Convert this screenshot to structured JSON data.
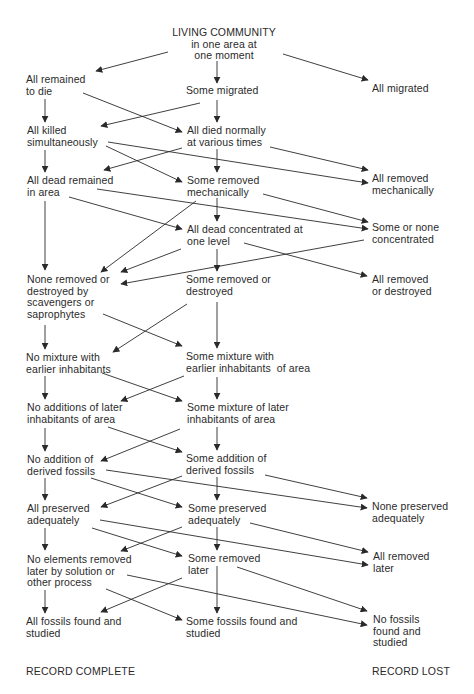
{
  "diagram": {
    "type": "flowchart",
    "nodes": [
      {
        "id": "root",
        "lines": [
          "LIVING COMMUNITY",
          "in one area at",
          "one moment"
        ],
        "x": 224,
        "y": 27,
        "align": "center"
      },
      {
        "id": "all_remained_to_die",
        "lines": [
          "All remained",
          "to die"
        ],
        "x": 26,
        "y": 74
      },
      {
        "id": "some_migrated",
        "lines": [
          "Some migrated"
        ],
        "x": 186,
        "y": 85
      },
      {
        "id": "all_migrated",
        "lines": [
          "All migrated"
        ],
        "x": 372,
        "y": 83
      },
      {
        "id": "all_killed_simultaneously",
        "lines": [
          "All killed",
          "simultaneously"
        ],
        "x": 27,
        "y": 125
      },
      {
        "id": "all_died_normally",
        "lines": [
          "All died normally",
          "at various times"
        ],
        "x": 187,
        "y": 125
      },
      {
        "id": "all_dead_remained",
        "lines": [
          "All dead remained",
          "in area"
        ],
        "x": 27,
        "y": 175
      },
      {
        "id": "some_removed_mechanically",
        "lines": [
          "Some removed",
          "mechanically"
        ],
        "x": 187,
        "y": 175
      },
      {
        "id": "all_removed_mechanically",
        "lines": [
          "All removed",
          "mechanically"
        ],
        "x": 372,
        "y": 173
      },
      {
        "id": "all_dead_concentrated",
        "lines": [
          "All dead concentrated at",
          "one level"
        ],
        "x": 187,
        "y": 224
      },
      {
        "id": "some_or_none_concentrated",
        "lines": [
          "Some or none",
          "concentrated"
        ],
        "x": 372,
        "y": 222
      },
      {
        "id": "none_removed_or_destroyed",
        "lines": [
          "None removed or",
          "destroyed by",
          "scavengers or",
          "saprophytes"
        ],
        "x": 27,
        "y": 274
      },
      {
        "id": "some_removed_or_destroyed",
        "lines": [
          "Some removed or",
          "destroyed"
        ],
        "x": 186,
        "y": 274
      },
      {
        "id": "all_removed_or_destroyed",
        "lines": [
          "All removed",
          "or destroyed"
        ],
        "x": 372,
        "y": 274
      },
      {
        "id": "no_mixture_earlier",
        "lines": [
          "No mixture with",
          "earlier inhabitants"
        ],
        "x": 26,
        "y": 352
      },
      {
        "id": "some_mixture_earlier",
        "lines": [
          "Some mixture with",
          "earlier inhabitants  of area"
        ],
        "x": 186,
        "y": 351
      },
      {
        "id": "no_additions_later",
        "lines": [
          "No additions of later",
          "inhabitants of area"
        ],
        "x": 27,
        "y": 402
      },
      {
        "id": "some_mixture_later",
        "lines": [
          "Some mixture of later",
          "inhabitants of area"
        ],
        "x": 187,
        "y": 402
      },
      {
        "id": "no_addition_derived",
        "lines": [
          "No addition of",
          "derived fossils"
        ],
        "x": 27,
        "y": 454
      },
      {
        "id": "some_addition_derived",
        "lines": [
          "Some addition of",
          "derived fossils"
        ],
        "x": 186,
        "y": 453
      },
      {
        "id": "all_preserved",
        "lines": [
          "All preserved",
          "adequately"
        ],
        "x": 27,
        "y": 503
      },
      {
        "id": "some_preserved",
        "lines": [
          "Some preserved",
          "adequately"
        ],
        "x": 188,
        "y": 503
      },
      {
        "id": "none_preserved",
        "lines": [
          "None preserved",
          "adequately"
        ],
        "x": 372,
        "y": 501
      },
      {
        "id": "no_elements_removed",
        "lines": [
          "No elements removed",
          "later by solution or",
          "other process"
        ],
        "x": 27,
        "y": 554
      },
      {
        "id": "some_removed_later",
        "lines": [
          "Some removed",
          "later"
        ],
        "x": 188,
        "y": 553
      },
      {
        "id": "all_removed_later",
        "lines": [
          "All removed",
          "later"
        ],
        "x": 373,
        "y": 551
      },
      {
        "id": "all_fossils_found",
        "lines": [
          "All fossils found and",
          "studied"
        ],
        "x": 26,
        "y": 616
      },
      {
        "id": "some_fossils_found",
        "lines": [
          "Some fossils found and",
          "studied"
        ],
        "x": 186,
        "y": 616
      },
      {
        "id": "no_fossils_found",
        "lines": [
          "No fossils",
          "found and",
          "studied"
        ],
        "x": 373,
        "y": 614
      }
    ],
    "edges": [
      {
        "from": "root",
        "to": "all_remained_to_die",
        "x1": 168,
        "y1": 52,
        "x2": 96,
        "y2": 71
      },
      {
        "from": "root",
        "to": "some_migrated",
        "x1": 217,
        "y1": 61,
        "x2": 217,
        "y2": 83
      },
      {
        "from": "root",
        "to": "all_migrated",
        "x1": 283,
        "y1": 54,
        "x2": 368,
        "y2": 80
      },
      {
        "from": "all_remained_to_die",
        "to": "all_killed_simultaneously",
        "x1": 45,
        "y1": 99,
        "x2": 45,
        "y2": 122
      },
      {
        "from": "all_remained_to_die",
        "to": "all_died_normally",
        "x1": 83,
        "y1": 93,
        "x2": 182,
        "y2": 132
      },
      {
        "from": "some_migrated",
        "to": "all_killed_simultaneously",
        "x1": 200,
        "y1": 103,
        "x2": 101,
        "y2": 126
      },
      {
        "from": "some_migrated",
        "to": "all_died_normally",
        "x1": 217,
        "y1": 100,
        "x2": 217,
        "y2": 122
      },
      {
        "from": "all_killed_simultaneously",
        "to": "all_dead_remained",
        "x1": 45,
        "y1": 150,
        "x2": 45,
        "y2": 172
      },
      {
        "from": "all_killed_simultaneously",
        "to": "some_removed_mechanically",
        "x1": 106,
        "y1": 146,
        "x2": 182,
        "y2": 182
      },
      {
        "from": "all_killed_simultaneously",
        "to": "all_removed_mechanically",
        "x1": 108,
        "y1": 142,
        "x2": 368,
        "y2": 183
      },
      {
        "from": "all_died_normally",
        "to": "all_dead_remained",
        "x1": 182,
        "y1": 148,
        "x2": 104,
        "y2": 170
      },
      {
        "from": "all_died_normally",
        "to": "some_removed_mechanically",
        "x1": 217,
        "y1": 149,
        "x2": 217,
        "y2": 172
      },
      {
        "from": "all_died_normally",
        "to": "all_removed_mechanically",
        "x1": 270,
        "y1": 147,
        "x2": 368,
        "y2": 170
      },
      {
        "from": "all_dead_remained",
        "to": "none_removed_or_destroyed",
        "x1": 45,
        "y1": 201,
        "x2": 45,
        "y2": 270
      },
      {
        "from": "all_dead_remained",
        "to": "all_dead_concentrated",
        "x1": 69,
        "y1": 197,
        "x2": 182,
        "y2": 229
      },
      {
        "from": "all_dead_remained",
        "to": "some_or_none_concentrated",
        "x1": 97,
        "y1": 189,
        "x2": 368,
        "y2": 229
      },
      {
        "from": "some_removed_mechanically",
        "to": "none_removed_or_destroyed",
        "x1": 196,
        "y1": 201,
        "x2": 101,
        "y2": 272
      },
      {
        "from": "some_removed_mechanically",
        "to": "all_dead_concentrated",
        "x1": 217,
        "y1": 198,
        "x2": 217,
        "y2": 221
      },
      {
        "from": "some_removed_mechanically",
        "to": "some_or_none_concentrated",
        "x1": 263,
        "y1": 194,
        "x2": 368,
        "y2": 222
      },
      {
        "from": "all_dead_concentrated",
        "to": "none_removed_or_destroyed",
        "x1": 181,
        "y1": 249,
        "x2": 121,
        "y2": 272
      },
      {
        "from": "all_dead_concentrated",
        "to": "some_removed_or_destroyed",
        "x1": 217,
        "y1": 249,
        "x2": 217,
        "y2": 271
      },
      {
        "from": "all_dead_concentrated",
        "to": "all_removed_or_destroyed",
        "x1": 244,
        "y1": 243,
        "x2": 367,
        "y2": 276
      },
      {
        "from": "some_or_none_concentrated",
        "to": "none_removed_or_destroyed",
        "x1": 364,
        "y1": 240,
        "x2": 121,
        "y2": 284
      },
      {
        "from": "none_removed_or_destroyed",
        "to": "no_mixture_earlier",
        "x1": 45,
        "y1": 325,
        "x2": 45,
        "y2": 349
      },
      {
        "from": "none_removed_or_destroyed",
        "to": "some_mixture_earlier",
        "x1": 103,
        "y1": 314,
        "x2": 182,
        "y2": 346
      },
      {
        "from": "some_removed_or_destroyed",
        "to": "no_mixture_earlier",
        "x1": 187,
        "y1": 304,
        "x2": 113,
        "y2": 352
      },
      {
        "from": "some_removed_or_destroyed",
        "to": "some_mixture_earlier",
        "x1": 217,
        "y1": 302,
        "x2": 217,
        "y2": 348
      },
      {
        "from": "no_mixture_earlier",
        "to": "no_additions_later",
        "x1": 45,
        "y1": 376,
        "x2": 45,
        "y2": 399
      },
      {
        "from": "no_mixture_earlier",
        "to": "some_mixture_later",
        "x1": 102,
        "y1": 373,
        "x2": 182,
        "y2": 401
      },
      {
        "from": "some_mixture_earlier",
        "to": "no_additions_later",
        "x1": 184,
        "y1": 376,
        "x2": 121,
        "y2": 401
      },
      {
        "from": "some_mixture_earlier",
        "to": "some_mixture_later",
        "x1": 217,
        "y1": 377,
        "x2": 217,
        "y2": 399
      },
      {
        "from": "no_additions_later",
        "to": "no_addition_derived",
        "x1": 45,
        "y1": 428,
        "x2": 45,
        "y2": 451
      },
      {
        "from": "no_additions_later",
        "to": "some_addition_derived",
        "x1": 108,
        "y1": 427,
        "x2": 182,
        "y2": 452
      },
      {
        "from": "some_mixture_later",
        "to": "no_addition_derived",
        "x1": 180,
        "y1": 429,
        "x2": 101,
        "y2": 461
      },
      {
        "from": "some_mixture_later",
        "to": "some_addition_derived",
        "x1": 217,
        "y1": 427,
        "x2": 217,
        "y2": 450
      },
      {
        "from": "no_addition_derived",
        "to": "all_preserved",
        "x1": 45,
        "y1": 478,
        "x2": 45,
        "y2": 500
      },
      {
        "from": "no_addition_derived",
        "to": "some_preserved",
        "x1": 91,
        "y1": 478,
        "x2": 182,
        "y2": 507
      },
      {
        "from": "no_addition_derived",
        "to": "none_preserved",
        "x1": 106,
        "y1": 470,
        "x2": 367,
        "y2": 508
      },
      {
        "from": "some_addition_derived",
        "to": "all_preserved",
        "x1": 182,
        "y1": 476,
        "x2": 101,
        "y2": 507
      },
      {
        "from": "some_addition_derived",
        "to": "some_preserved",
        "x1": 217,
        "y1": 477,
        "x2": 217,
        "y2": 500
      },
      {
        "from": "some_addition_derived",
        "to": "none_preserved",
        "x1": 265,
        "y1": 475,
        "x2": 367,
        "y2": 498
      },
      {
        "from": "all_preserved",
        "to": "no_elements_removed",
        "x1": 45,
        "y1": 528,
        "x2": 45,
        "y2": 550
      },
      {
        "from": "all_preserved",
        "to": "some_removed_later",
        "x1": 92,
        "y1": 528,
        "x2": 182,
        "y2": 556
      },
      {
        "from": "all_preserved",
        "to": "all_removed_later",
        "x1": 100,
        "y1": 520,
        "x2": 368,
        "y2": 565
      },
      {
        "from": "some_preserved",
        "to": "no_elements_removed",
        "x1": 182,
        "y1": 527,
        "x2": 121,
        "y2": 551
      },
      {
        "from": "some_preserved",
        "to": "some_removed_later",
        "x1": 217,
        "y1": 527,
        "x2": 217,
        "y2": 550
      },
      {
        "from": "some_preserved",
        "to": "all_removed_later",
        "x1": 250,
        "y1": 523,
        "x2": 368,
        "y2": 552
      },
      {
        "from": "no_elements_removed",
        "to": "all_fossils_found",
        "x1": 45,
        "y1": 590,
        "x2": 45,
        "y2": 613
      },
      {
        "from": "no_elements_removed",
        "to": "some_fossils_found",
        "x1": 106,
        "y1": 589,
        "x2": 182,
        "y2": 620
      },
      {
        "from": "no_elements_removed",
        "to": "no_fossils_found",
        "x1": 127,
        "y1": 575,
        "x2": 367,
        "y2": 625
      },
      {
        "from": "some_removed_later",
        "to": "all_fossils_found",
        "x1": 182,
        "y1": 578,
        "x2": 101,
        "y2": 612
      },
      {
        "from": "some_removed_later",
        "to": "some_fossils_found",
        "x1": 217,
        "y1": 566,
        "x2": 217,
        "y2": 613
      },
      {
        "from": "some_removed_later",
        "to": "no_fossils_found",
        "x1": 237,
        "y1": 567,
        "x2": 367,
        "y2": 611
      }
    ],
    "footer": {
      "left": "RECORD COMPLETE",
      "right": "RECORD LOST"
    },
    "colors": {
      "text": "#2a2a2a",
      "line": "#2a2a2a",
      "background": "#ffffff"
    }
  }
}
